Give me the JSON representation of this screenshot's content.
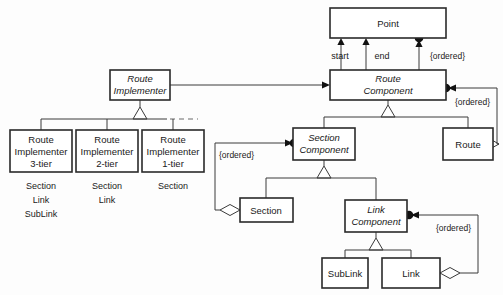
{
  "diagram": {
    "colors": {
      "background": "#fdfdfd",
      "box_fill": "#ffffff",
      "box_stroke": "#2a2a2a",
      "line": "#3a3a3a",
      "dot": "#111111"
    },
    "classes": {
      "point": "Point",
      "route_component_line1": "Route",
      "route_component_line2": "Component",
      "route_implementer_line1": "Route",
      "route_implementer_line2": "Implementer",
      "route_impl_3tier_line1": "Route",
      "route_impl_3tier_line2": "Implementer",
      "route_impl_3tier_line3": "3-tier",
      "route_impl_2tier_line1": "Route",
      "route_impl_2tier_line2": "Implementer",
      "route_impl_2tier_line3": "2-tier",
      "route_impl_1tier_line1": "Route",
      "route_impl_1tier_line2": "Implementer",
      "route_impl_1tier_line3": "1-tier",
      "route": "Route",
      "section_component_line1": "Section",
      "section_component_line2": "Component",
      "section": "Section",
      "link_component_line1": "Link",
      "link_component_line2": "Component",
      "sublink": "SubLink",
      "link": "Link"
    },
    "captions": {
      "impl3_1": "Section",
      "impl3_2": "Link",
      "impl3_3": "SubLink",
      "impl2_1": "Section",
      "impl2_2": "Link",
      "impl1_1": "Section"
    },
    "labels": {
      "start": "start",
      "end": "end",
      "ordered_point": "{ordered}",
      "ordered_route": "{ordered}",
      "ordered_section": "{ordered}",
      "ordered_link": "{ordered}"
    }
  }
}
